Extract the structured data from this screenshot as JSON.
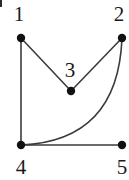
{
  "figure": {
    "type": "undirected-graph-drawing",
    "background_color": "#ffffff",
    "stroke_color": "#3c3c3c",
    "vertex_color": "#111111",
    "label_color": "#1a1a1a",
    "width": 129,
    "height": 180,
    "vertex_radius": 4.2,
    "edge_width": 1.6
  },
  "vertices": [
    {
      "id": "1",
      "label": "1",
      "x": 21,
      "y": 38,
      "label_x": 19,
      "label_y": 14
    },
    {
      "id": "2",
      "label": "2",
      "x": 122,
      "y": 38,
      "label_x": 119,
      "label_y": 14
    },
    {
      "id": "3",
      "label": "3",
      "x": 71,
      "y": 91,
      "label_x": 70,
      "label_y": 70
    },
    {
      "id": "4",
      "label": "4",
      "x": 21,
      "y": 145,
      "label_x": 21,
      "label_y": 167
    },
    {
      "id": "5",
      "label": "5",
      "x": 122,
      "y": 145,
      "label_x": 122,
      "label_y": 167
    }
  ],
  "edges": [
    {
      "id": "edge-1-3",
      "from": "1",
      "to": "3",
      "shape": "straight"
    },
    {
      "id": "edge-3-2",
      "from": "3",
      "to": "2",
      "shape": "straight"
    },
    {
      "id": "edge-1-4",
      "from": "1",
      "to": "4",
      "shape": "straight"
    },
    {
      "id": "edge-4-5",
      "from": "4",
      "to": "5",
      "shape": "straight"
    },
    {
      "id": "edge-2-4",
      "from": "2",
      "to": "4",
      "shape": "curved",
      "curve_control_x": 118,
      "curve_control_y": 141
    }
  ],
  "annotations": {
    "corner_mark": "crop-artifact"
  }
}
